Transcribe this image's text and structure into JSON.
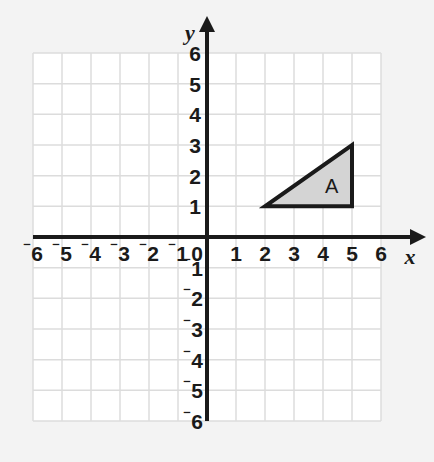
{
  "figure": {
    "kind": "coordinate-plane",
    "background_color": "#f3f3f3",
    "plot_background_color": "#ffffff",
    "grid_color": "#dcdcdc",
    "axis_color": "#1a1a1a"
  },
  "axes": {
    "x_name": "x",
    "y_name": "y",
    "x_min": -6,
    "x_max": 6,
    "y_min": -6,
    "y_max": 6,
    "origin_label": "0",
    "x_tick_labels_negative": [
      "-6",
      "-5",
      "-4",
      "-3",
      "-2",
      "-1"
    ],
    "x_tick_labels_positive": [
      "1",
      "2",
      "3",
      "4",
      "5",
      "6"
    ],
    "y_tick_labels_positive": [
      "1",
      "2",
      "3",
      "4",
      "5",
      "6"
    ],
    "y_tick_labels_negative": [
      "-1",
      "-2",
      "-3",
      "-4",
      "-5",
      "-6"
    ],
    "minus_glyph": "⁻"
  },
  "chart_data": {
    "type": "scatter",
    "title": "",
    "xlabel": "x",
    "ylabel": "y",
    "xlim": [
      -6,
      6
    ],
    "ylim": [
      -6,
      6
    ],
    "grid": true,
    "legend": "none",
    "xticks": [
      -6,
      -5,
      -4,
      -3,
      -2,
      -1,
      0,
      1,
      2,
      3,
      4,
      5,
      6
    ],
    "yticks": [
      -6,
      -5,
      -4,
      -3,
      -2,
      -1,
      0,
      1,
      2,
      3,
      4,
      5,
      6
    ],
    "shapes": [
      {
        "name": "A",
        "type": "triangle",
        "vertices": [
          [
            2,
            1
          ],
          [
            5,
            1
          ],
          [
            5,
            3
          ]
        ],
        "fill_color": "#d4d4d4",
        "stroke_color": "#1a1a1a",
        "label": "A",
        "label_position": [
          4.3,
          1.62
        ]
      }
    ]
  }
}
